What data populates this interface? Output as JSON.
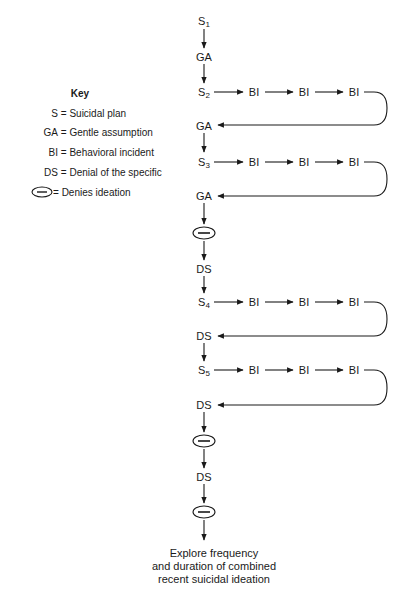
{
  "key": {
    "title": "Key",
    "items": [
      {
        "symbol": "S",
        "meaning": "Suicidal plan"
      },
      {
        "symbol": "GA",
        "meaning": "Gentle assumption"
      },
      {
        "symbol": "BI",
        "meaning": "Behavioral incident"
      },
      {
        "symbol": "DS",
        "meaning": "Denial of the specific"
      },
      {
        "symbol": "ellipse-minus",
        "meaning": "Denies ideation"
      }
    ]
  },
  "flow": {
    "nodes": [
      {
        "id": "s1",
        "label": "S",
        "sub": "1"
      },
      {
        "id": "ga1",
        "label": "GA"
      },
      {
        "id": "s2",
        "label": "S",
        "sub": "2"
      },
      {
        "id": "ga2",
        "label": "GA"
      },
      {
        "id": "s3",
        "label": "S",
        "sub": "3"
      },
      {
        "id": "ga3",
        "label": "GA"
      },
      {
        "id": "deny1",
        "label": "ellipse-minus"
      },
      {
        "id": "ds1",
        "label": "DS"
      },
      {
        "id": "s4",
        "label": "S",
        "sub": "4"
      },
      {
        "id": "ds2",
        "label": "DS"
      },
      {
        "id": "s5",
        "label": "S",
        "sub": "5"
      },
      {
        "id": "ds3",
        "label": "DS"
      },
      {
        "id": "deny2",
        "label": "ellipse-minus"
      },
      {
        "id": "ds4",
        "label": "DS"
      },
      {
        "id": "deny3",
        "label": "ellipse-minus"
      }
    ],
    "bi_label": "BI",
    "final": [
      "Explore frequency",
      "and duration of combined",
      "recent suicidal ideation"
    ]
  }
}
